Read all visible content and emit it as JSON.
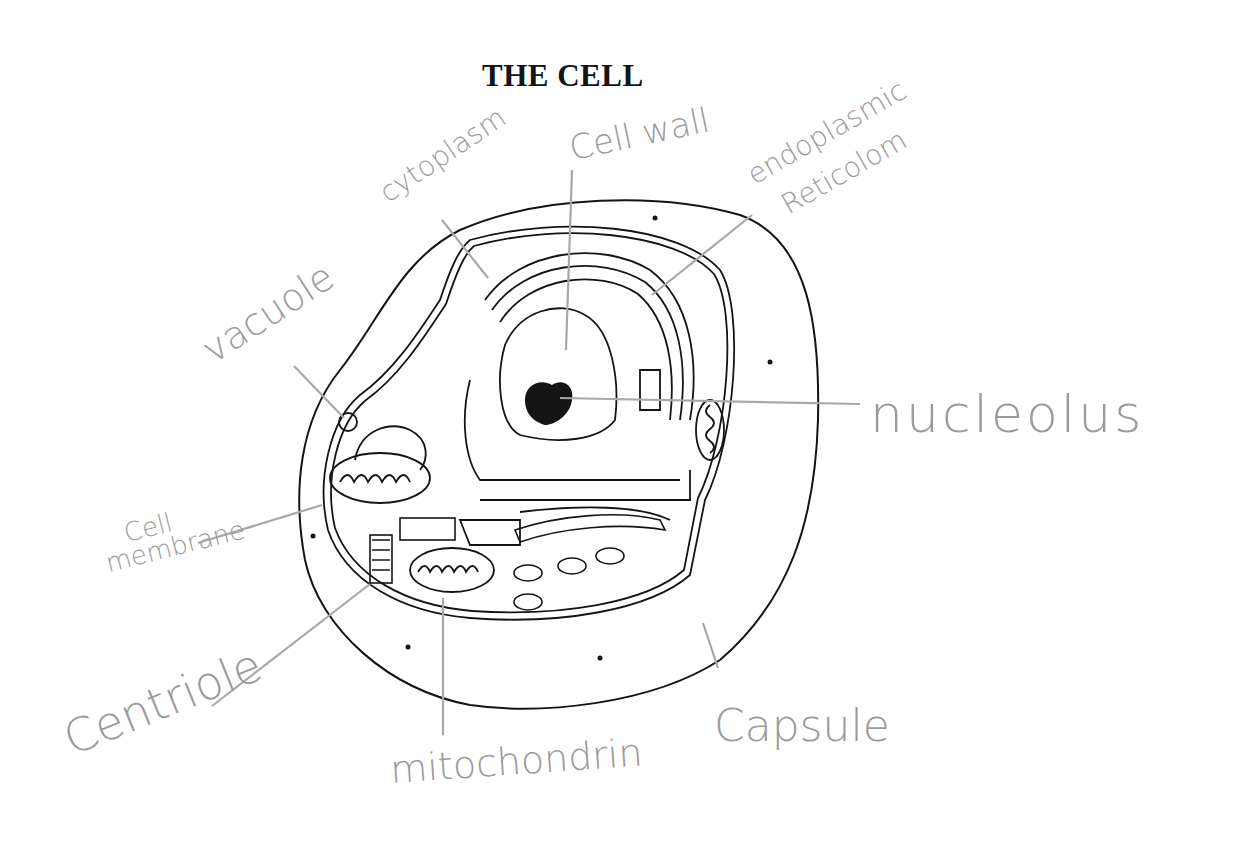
{
  "title": "THE CELL",
  "colors": {
    "ink": "#141414",
    "pencil": "#9a9a9a",
    "background": "#ffffff"
  },
  "labels": {
    "cytoplasm": "cytoplasm",
    "cell_wall": "Cell wall",
    "endoplasmic_1": "endoplasmic",
    "endoplasmic_2": "Reticolom",
    "vacuole": "vacuole",
    "nucleolus": "nucleolus",
    "cell_membrane_1": "Cell",
    "cell_membrane_2": "membrane",
    "centriole": "Centriole",
    "mitochondrin": "mitochondrin",
    "capsule": "Capsule"
  }
}
